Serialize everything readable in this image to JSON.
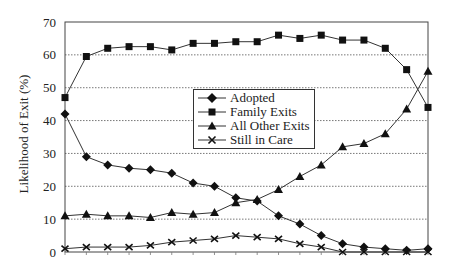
{
  "chart_data": {
    "type": "line",
    "title": "",
    "xlabel": "",
    "ylabel": "Likelihood of Exit (%)",
    "ylim": [
      0,
      70
    ],
    "yticks": [
      0,
      10,
      20,
      30,
      40,
      50,
      60,
      70
    ],
    "grid": "horizontal dotted",
    "legend_position": "center inside plot",
    "x": [
      1,
      2,
      3,
      4,
      5,
      6,
      7,
      8,
      9,
      10,
      11,
      12,
      13,
      14,
      15,
      16,
      17,
      18
    ],
    "x_tick_labels": [],
    "series": [
      {
        "name": "Adopted",
        "marker": "diamond",
        "values": [
          42,
          29,
          26.5,
          25.5,
          25,
          24,
          21,
          20,
          16.5,
          15.5,
          11,
          8.5,
          5,
          2.5,
          1.5,
          1,
          0.5,
          1
        ]
      },
      {
        "name": "Family Exits",
        "marker": "square",
        "values": [
          47,
          59.5,
          62,
          62.5,
          62.5,
          61.5,
          63.5,
          63.5,
          64,
          64,
          66,
          65,
          66,
          64.5,
          64.5,
          62,
          55.5,
          44
        ]
      },
      {
        "name": "All Other Exits",
        "marker": "triangle",
        "values": [
          11,
          11.5,
          11,
          11,
          10.5,
          12,
          11.5,
          12,
          15,
          16,
          19,
          23,
          26.5,
          32,
          33,
          36,
          43.5,
          55
        ]
      },
      {
        "name": "Still in Care",
        "marker": "x",
        "values": [
          1,
          1.5,
          1.5,
          1.5,
          2,
          3,
          3.5,
          4,
          5,
          4.5,
          4,
          2.5,
          1.5,
          0,
          0,
          0,
          0,
          0
        ]
      }
    ]
  },
  "axis": {
    "ylabel": "Likelihood of Exit (%)",
    "yticks": [
      "0",
      "10",
      "20",
      "30",
      "40",
      "50",
      "60",
      "70"
    ]
  },
  "legend": {
    "items": [
      "Adopted",
      "Family Exits",
      "All Other Exits",
      "Still in Care"
    ]
  }
}
